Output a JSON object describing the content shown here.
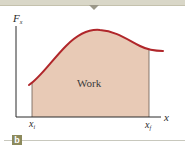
{
  "figure": {
    "y_axis_label": "F",
    "y_axis_label_subscript": "x",
    "x_axis_label": "x",
    "area_label": "Work",
    "lower_bound_label": "x",
    "lower_bound_subscript": "i",
    "upper_bound_label": "x",
    "upper_bound_subscript": "f",
    "panel_label": "b"
  },
  "colors": {
    "curve": "#b0262a",
    "area_fill": "#e8cab6",
    "axis": "#2a2a2a",
    "badge": "#8c8a5c",
    "banner": "#d9d7c8"
  }
}
